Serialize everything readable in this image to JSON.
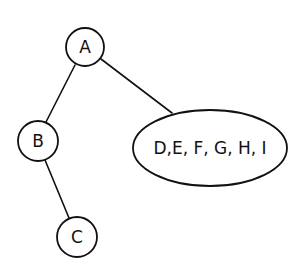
{
  "diagram": {
    "type": "tree",
    "colors": {
      "stroke": "#111111",
      "background": "#ffffff"
    },
    "nodes": [
      {
        "id": "A",
        "label": "A",
        "shape": "circle",
        "cx": 85,
        "cy": 47,
        "r": 19
      },
      {
        "id": "B",
        "label": "B",
        "shape": "circle",
        "cx": 38,
        "cy": 141,
        "r": 20
      },
      {
        "id": "C",
        "label": "C",
        "shape": "circle",
        "cx": 77,
        "cy": 237,
        "r": 20
      },
      {
        "id": "DEFGHI",
        "label": "D,E, F, G, H, I",
        "shape": "ellipse",
        "cx": 210,
        "cy": 148,
        "rx": 77,
        "ry": 38
      }
    ],
    "edges": [
      {
        "from": "A",
        "to": "B"
      },
      {
        "from": "A",
        "to": "DEFGHI"
      },
      {
        "from": "B",
        "to": "C"
      }
    ]
  }
}
